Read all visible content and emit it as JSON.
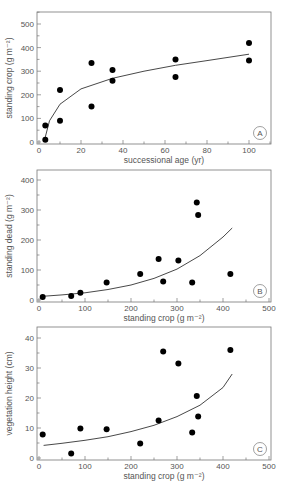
{
  "chart_data": [
    {
      "type": "scatter",
      "panel": "A",
      "title": "",
      "xlabel": "successional age (yr)",
      "ylabel": "standing crop (g m⁻²)",
      "xlim": [
        0,
        110
      ],
      "ylim": [
        0,
        550
      ],
      "xticks": [
        0,
        20,
        40,
        60,
        80,
        100
      ],
      "yticks": [
        0,
        100,
        200,
        300,
        400,
        500
      ],
      "grid": false,
      "points": [
        {
          "x": 3,
          "y": 10
        },
        {
          "x": 3,
          "y": 70
        },
        {
          "x": 10,
          "y": 90
        },
        {
          "x": 10,
          "y": 220
        },
        {
          "x": 25,
          "y": 150
        },
        {
          "x": 25,
          "y": 335
        },
        {
          "x": 35,
          "y": 260
        },
        {
          "x": 35,
          "y": 305
        },
        {
          "x": 65,
          "y": 275
        },
        {
          "x": 65,
          "y": 350
        },
        {
          "x": 100,
          "y": 345
        },
        {
          "x": 100,
          "y": 420
        }
      ],
      "fit": {
        "type": "logarithmic",
        "x": [
          2.5,
          5,
          10,
          20,
          35,
          50,
          65,
          80,
          100
        ],
        "y": [
          5,
          90,
          160,
          225,
          270,
          300,
          325,
          345,
          372
        ]
      }
    },
    {
      "type": "scatter",
      "panel": "B",
      "title": "",
      "xlabel": "standing crop (g m⁻²)",
      "ylabel": "standing dead (g m⁻²)",
      "xlim": [
        0,
        500
      ],
      "ylim": [
        0,
        440
      ],
      "xticks": [
        0,
        100,
        200,
        300,
        400,
        500
      ],
      "yticks": [
        0,
        100,
        200,
        300,
        400
      ],
      "grid": false,
      "points": [
        {
          "x": 8,
          "y": 10
        },
        {
          "x": 70,
          "y": 13
        },
        {
          "x": 90,
          "y": 24
        },
        {
          "x": 147,
          "y": 58
        },
        {
          "x": 220,
          "y": 87
        },
        {
          "x": 260,
          "y": 137
        },
        {
          "x": 270,
          "y": 62
        },
        {
          "x": 303,
          "y": 132
        },
        {
          "x": 333,
          "y": 58
        },
        {
          "x": 343,
          "y": 325
        },
        {
          "x": 346,
          "y": 283
        },
        {
          "x": 416,
          "y": 87
        }
      ],
      "fit": {
        "type": "exponential",
        "x": [
          5,
          50,
          100,
          150,
          200,
          250,
          300,
          350,
          400,
          420
        ],
        "y": [
          12,
          17,
          24,
          35,
          50,
          72,
          103,
          148,
          210,
          240
        ]
      }
    },
    {
      "type": "scatter",
      "panel": "C",
      "title": "",
      "xlabel": "standing crop (g m⁻²)",
      "ylabel": "vegetation height (cm)",
      "xlim": [
        0,
        500
      ],
      "ylim": [
        0,
        44
      ],
      "xticks": [
        0,
        100,
        200,
        300,
        400,
        500
      ],
      "yticks": [
        0,
        10,
        20,
        30,
        40
      ],
      "grid": false,
      "points": [
        {
          "x": 8,
          "y": 7.8
        },
        {
          "x": 70,
          "y": 1.5
        },
        {
          "x": 90,
          "y": 9.8
        },
        {
          "x": 147,
          "y": 9.6
        },
        {
          "x": 220,
          "y": 4.8
        },
        {
          "x": 260,
          "y": 12.5
        },
        {
          "x": 270,
          "y": 35.5
        },
        {
          "x": 303,
          "y": 31.5
        },
        {
          "x": 333,
          "y": 8.5
        },
        {
          "x": 343,
          "y": 20.7
        },
        {
          "x": 346,
          "y": 13.8
        },
        {
          "x": 416,
          "y": 36
        }
      ],
      "fit": {
        "type": "exponential",
        "x": [
          10,
          50,
          100,
          150,
          200,
          250,
          300,
          350,
          400,
          420
        ],
        "y": [
          4.2,
          4.9,
          5.9,
          7.1,
          8.8,
          10.9,
          13.8,
          17.6,
          23.5,
          28
        ]
      }
    }
  ],
  "panels": [
    {
      "badge": "A",
      "xlabel": "successional age (yr)",
      "ylabel": "standing crop (g m⁻²)"
    },
    {
      "badge": "B",
      "xlabel": "standing crop (g m⁻²)",
      "ylabel": "standing dead (g m⁻²)"
    },
    {
      "badge": "C",
      "xlabel": "standing crop (g m⁻²)",
      "ylabel": "vegetation height (cm)"
    }
  ],
  "colors": {
    "axis": "#777777",
    "point": "#000000",
    "curve": "#333333",
    "text": "#555555"
  }
}
